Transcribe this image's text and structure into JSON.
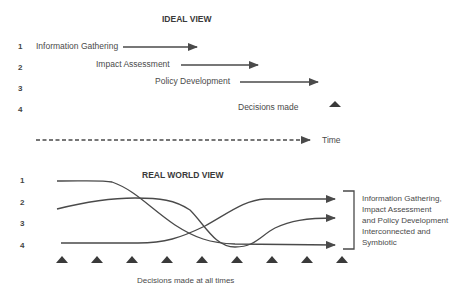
{
  "ideal_view": {
    "title": "IDEAL VIEW",
    "row_numbers": [
      "1",
      "2",
      "3",
      "4"
    ],
    "stages": [
      {
        "label": "Information Gathering",
        "row": 1
      },
      {
        "label": "Impact Assessment",
        "row": 2
      },
      {
        "label": "Policy Development",
        "row": 3
      }
    ],
    "decision_label": "Decisions made",
    "time_label": "Time"
  },
  "real_world_view": {
    "title": "REAL WORLD VIEW",
    "row_numbers": [
      "1",
      "2",
      "3",
      "4"
    ],
    "decision_markers_count": 9,
    "decision_label": "Decisions made at all times",
    "bracket_note": [
      "Information Gathering,",
      "Impact Assessment",
      "and Policy Development",
      "Interconnected and",
      "Symbiotic"
    ]
  },
  "colors": {
    "line": "#4a4a4a",
    "text": "#4a4a4a",
    "background": "#ffffff"
  }
}
